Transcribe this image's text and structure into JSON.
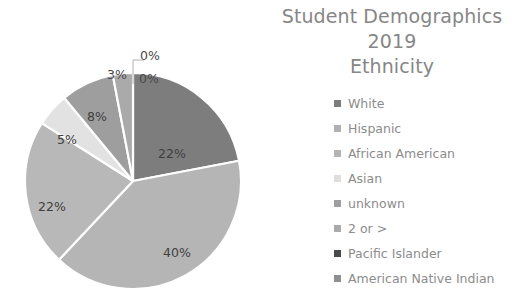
{
  "title": {
    "lines": [
      "Student Demographics",
      "2019",
      "Ethnicity"
    ],
    "color": "#868686"
  },
  "chart_data": {
    "type": "pie",
    "title": "Student Demographics 2019 Ethnicity",
    "subtitle": "2019",
    "xlabel": "",
    "ylabel": "",
    "legend_position": "right",
    "grid": false,
    "categories": [
      "White",
      "Hispanic",
      "African American",
      "Asian",
      "unknown",
      "2 or >",
      "Pacific Islander",
      "American Native Indian"
    ],
    "values": [
      22,
      40,
      22,
      5,
      8,
      3,
      0,
      0
    ],
    "value_labels": [
      "22%",
      "40%",
      "22%",
      "5%",
      "8%",
      "3%",
      "0%",
      "0%"
    ],
    "colors": [
      "#7d7d7d",
      "#b5b5b5",
      "#b8b8b8",
      "#e2e2e2",
      "#9e9e9e",
      "#aaaaaa",
      "#4a4a4a",
      "#8f8f8f"
    ],
    "slices": [
      {
        "label": "White",
        "value": 22,
        "display": "22%",
        "color": "#7d7d7d",
        "start_deg": 0,
        "end_deg": 79.2,
        "label_x": 172,
        "label_y": 153,
        "outside": false
      },
      {
        "label": "Hispanic",
        "value": 40,
        "display": "40%",
        "color": "#b5b5b5",
        "start_deg": 79.2,
        "end_deg": 223.2,
        "label_x": 177,
        "label_y": 252,
        "outside": false
      },
      {
        "label": "African American",
        "value": 22,
        "display": "22%",
        "color": "#b8b8b8",
        "start_deg": 223.2,
        "end_deg": 302.4,
        "label_x": 52,
        "label_y": 206,
        "outside": false
      },
      {
        "label": "Asian",
        "value": 5,
        "display": "5%",
        "color": "#e2e2e2",
        "start_deg": 302.4,
        "end_deg": 320.4,
        "label_x": 67,
        "label_y": 139,
        "outside": false
      },
      {
        "label": "unknown",
        "value": 8,
        "display": "8%",
        "color": "#9e9e9e",
        "start_deg": 320.4,
        "end_deg": 349.2,
        "label_x": 97,
        "label_y": 116,
        "outside": false
      },
      {
        "label": "2 or >",
        "value": 3,
        "display": "3%",
        "color": "#aaaaaa",
        "start_deg": 349.2,
        "end_deg": 360,
        "label_x": 117,
        "label_y": 74,
        "outside": true
      },
      {
        "label": "Pacific Islander",
        "value": 0,
        "display": "0%",
        "color": "#4a4a4a",
        "start_deg": 360,
        "end_deg": 360,
        "label_x": 149,
        "label_y": 78,
        "outside": true
      },
      {
        "label": "American Native Indian",
        "value": 0,
        "display": "0%",
        "color": "#8f8f8f",
        "start_deg": 360,
        "end_deg": 360,
        "label_x": 150,
        "label_y": 55,
        "outside": true
      }
    ],
    "geometry": {
      "cx": 133,
      "cy": 181,
      "r": 108
    }
  },
  "legend": {
    "items": [
      {
        "label": "White",
        "color": "#7d7d7d"
      },
      {
        "label": "Hispanic",
        "color": "#b0b0b0"
      },
      {
        "label": "African American",
        "color": "#b4b4b4"
      },
      {
        "label": "Asian",
        "color": "#dedede"
      },
      {
        "label": "unknown",
        "color": "#9e9e9e"
      },
      {
        "label": "2 or >",
        "color": "#aaaaaa"
      },
      {
        "label": "Pacific Islander",
        "color": "#4a4a4a"
      },
      {
        "label": "American Native Indian",
        "color": "#8f8f8f"
      }
    ]
  }
}
